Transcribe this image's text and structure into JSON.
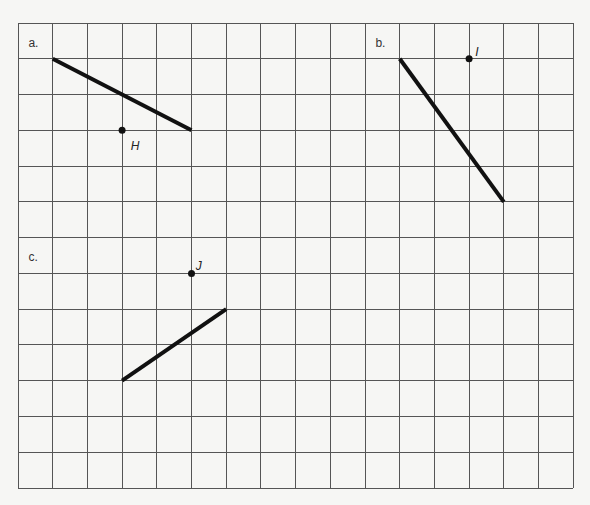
{
  "grid": {
    "columns": 16,
    "rows": 13,
    "origin_px": [
      18,
      23
    ],
    "cell_width_px": 34.7,
    "cell_height_px": 35.77,
    "line_color": "#555555",
    "background": "#f6f6f4"
  },
  "parts": [
    {
      "label": "a.",
      "label_cell": [
        0.3,
        0.55
      ],
      "segment": {
        "from": [
          1,
          1
        ],
        "to": [
          5,
          3
        ]
      },
      "point": {
        "name": "H",
        "cell": [
          3,
          3
        ],
        "label_offset": [
          0.25,
          0.45
        ]
      }
    },
    {
      "label": "b.",
      "label_cell": [
        10.3,
        0.55
      ],
      "segment": {
        "from": [
          11,
          1
        ],
        "to": [
          14,
          5
        ]
      },
      "point": {
        "name": "I",
        "cell": [
          13,
          1
        ],
        "label_offset": [
          0.18,
          -0.2
        ]
      }
    },
    {
      "label": "c.",
      "label_cell": [
        0.3,
        6.55
      ],
      "segment": {
        "from": [
          3,
          10
        ],
        "to": [
          6,
          8
        ]
      },
      "point": {
        "name": "J",
        "cell": [
          5,
          7
        ],
        "label_offset": [
          0.12,
          -0.2
        ]
      }
    }
  ],
  "colors": {
    "segment": "#111111",
    "point": "#111111",
    "label_text": "#333333"
  }
}
